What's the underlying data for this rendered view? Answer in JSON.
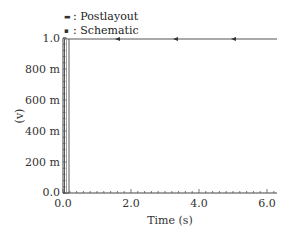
{
  "chart_data": {
    "type": "line",
    "title": "",
    "xlabel": "Time (s)",
    "ylabel": "(v)",
    "xlim": [
      0.0,
      6.3
    ],
    "ylim": [
      0.0,
      1.0
    ],
    "x_ticks": [
      "0.0",
      "2.0",
      "4.0",
      "6.0"
    ],
    "y_ticks": [
      "0.0",
      "200 m",
      "400 m",
      "600 m",
      "800 m",
      "1.0"
    ],
    "legend": [
      {
        "marker": "▬",
        "label": "Postlayout"
      },
      {
        "marker": "▪",
        "label": "Schematic"
      }
    ],
    "legend_position": "top-left (above plot)",
    "grid": false,
    "series": [
      {
        "name": "Postlayout",
        "x": [
          0.0,
          0.02,
          0.02,
          6.3
        ],
        "y": [
          0.0,
          0.0,
          1.0,
          1.0
        ]
      },
      {
        "name": "Schematic",
        "x": [
          0.0,
          0.18,
          0.18,
          6.3
        ],
        "y": [
          0.0,
          0.0,
          1.0,
          1.0
        ]
      }
    ],
    "annotations": [
      "arrow markers along 1.0 V line at ~1.5 s, ~3.3 s, ~5.0 s"
    ]
  }
}
